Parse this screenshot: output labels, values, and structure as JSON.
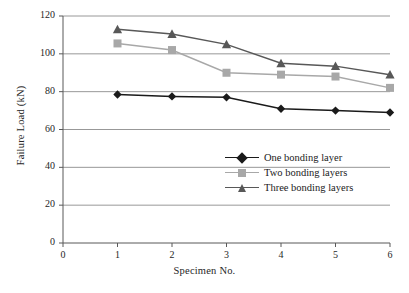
{
  "chart_data": {
    "type": "line",
    "title": "",
    "xlabel": "Specimen No.",
    "ylabel": "Failure Load (kN)",
    "x": [
      1,
      2,
      3,
      4,
      5,
      6
    ],
    "xlim": [
      0,
      6
    ],
    "ylim": [
      0,
      120
    ],
    "xticks": [
      "0",
      "1",
      "2",
      "3",
      "4",
      "5",
      "6"
    ],
    "yticks": [
      "0",
      "20",
      "40",
      "60",
      "80",
      "100",
      "120"
    ],
    "grid": "horizontal",
    "legend_position": "center-right",
    "series": [
      {
        "name": "One bonding layer",
        "marker": "diamond",
        "color": "#1a1a1a",
        "values": [
          78.5,
          77.5,
          77.0,
          71.0,
          70.0,
          69.0
        ]
      },
      {
        "name": "Two bonding layers",
        "marker": "square",
        "color": "#a8a8a8",
        "values": [
          105.5,
          102.0,
          90.0,
          89.0,
          88.0,
          82.0
        ]
      },
      {
        "name": "Three bonding layers",
        "marker": "triangle",
        "color": "#585858",
        "values": [
          113.0,
          110.5,
          105.0,
          95.0,
          93.5,
          89.0
        ]
      }
    ]
  },
  "colors": {
    "axis": "#595959",
    "grid": "#8c8c8c",
    "series_one": "#1a1a1a",
    "series_two": "#a8a8a8",
    "series_three": "#585858",
    "background": "#ffffff"
  },
  "legend": {
    "items": [
      {
        "label": "One bonding layer"
      },
      {
        "label": "Two bonding layers"
      },
      {
        "label": "Three bonding layers"
      }
    ]
  }
}
